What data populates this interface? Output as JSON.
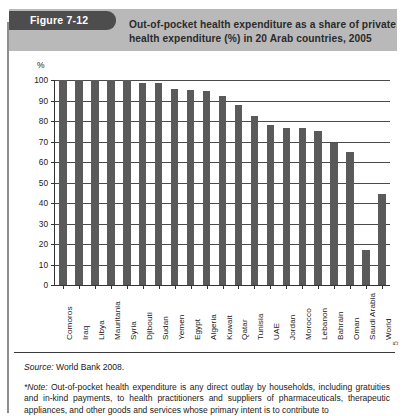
{
  "figure": {
    "tab_label": "Figure 7-12",
    "title_line1": "Out-of-pocket health expenditure as a share of private",
    "title_line2": "health expenditure (%) in 20 Arab countries, 2005"
  },
  "chart_data": {
    "type": "bar",
    "title": "Out-of-pocket health expenditure as a share of private health expenditure (%) in 20 Arab countries, 2005",
    "xlabel": "",
    "ylabel": "%",
    "ylim": [
      0,
      100
    ],
    "ytick_values": [
      0,
      10,
      20,
      30,
      40,
      50,
      60,
      70,
      80,
      90,
      100
    ],
    "ytick_labels": [
      "0",
      "10",
      "20",
      "30",
      "40",
      "50",
      "60",
      "70",
      "80",
      "90",
      "100"
    ],
    "grid": true,
    "legend": "none",
    "bar_color": "#5a5a5a",
    "categories": [
      "Comoros",
      "Iraq",
      "Libya",
      "Mauritania",
      "Syria",
      "Djibouti",
      "Sudan",
      "Yemen",
      "Egypt",
      "Algeria",
      "Kuwait",
      "Qatar",
      "Tunisia",
      "UAE",
      "Jordan",
      "Morocco",
      "Lebanon",
      "Bahrain",
      "Oman",
      "Saudi Arabia",
      "World"
    ],
    "values": [
      100,
      100,
      100,
      100,
      100,
      98.5,
      98.5,
      95.5,
      95,
      94.5,
      92,
      88,
      82.5,
      78,
      76.5,
      76.5,
      75,
      69.5,
      65,
      17,
      44.5
    ]
  },
  "footer": {
    "source_label": "Source:",
    "source_text": "World Bank 2008.",
    "note_label": "*Note:",
    "note_text": "Out-of-pocket health expenditure is any direct outlay by households, including gratuities and in-kind payments, to health practitioners and suppliers of pharmaceuticals, therapeutic appliances, and other goods and services whose primary intent is to contribute to",
    "page_number": "5"
  }
}
